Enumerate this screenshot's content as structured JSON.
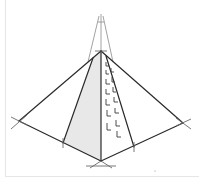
{
  "figure": {
    "colors": {
      "background": "#ffffff",
      "line": "#2a2a2a",
      "construction_line": "#8a8a8a",
      "shade": "#e4e4e4",
      "frame": "#e6e6e6"
    },
    "points": {
      "apex": [
        101,
        51
      ],
      "vanishing_top": [
        101,
        18
      ],
      "left_corner": [
        19,
        121
      ],
      "right_corner": [
        183,
        123
      ],
      "front_corner": [
        101,
        161
      ],
      "left_inner_base": [
        63,
        143
      ],
      "right_inner_base": [
        134,
        147
      ]
    },
    "brick_marks": 14
  }
}
